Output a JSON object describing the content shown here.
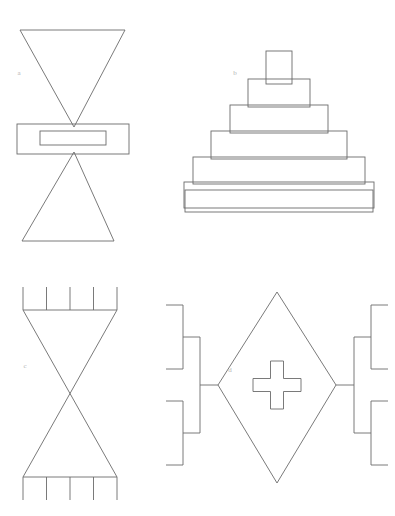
{
  "figure": {
    "background_color": "#ffffff",
    "stroke_color": "#6b6b6b",
    "label_color": "#b4b4b4",
    "canvas": {
      "width": 395,
      "height": 516
    },
    "panels": [
      {
        "id": "a",
        "label": "a",
        "label_x": 19,
        "label_y": 73,
        "description": "Inverted triangle above a horizontal rectangle with an inner rectangle, above an upright triangle",
        "shapes": {
          "top_triangle": "20,30 125,30 74,127",
          "outer_rectangle": {
            "x": 17,
            "y": 124,
            "width": 112,
            "height": 30
          },
          "inner_rectangle": {
            "x": 40,
            "y": 131,
            "width": 66,
            "height": 14
          },
          "bottom_triangle": "74,152 22,241 114,241"
        }
      },
      {
        "id": "b",
        "label": "b",
        "label_x": 235,
        "label_y": 73,
        "description": "Stepped pyramid built from seven overlapping rectangles",
        "step_count": 7,
        "rectangles": [
          {
            "x": 266,
            "y": 51,
            "width": 26,
            "height": 33
          },
          {
            "x": 248,
            "y": 79,
            "width": 62,
            "height": 28
          },
          {
            "x": 230,
            "y": 105,
            "width": 98,
            "height": 28
          },
          {
            "x": 211,
            "y": 131,
            "width": 136,
            "height": 28
          },
          {
            "x": 193,
            "y": 157,
            "width": 172,
            "height": 27
          },
          {
            "x": 184,
            "y": 182,
            "width": 190,
            "height": 26
          },
          {
            "x": 185,
            "y": 190,
            "width": 188,
            "height": 22
          }
        ]
      },
      {
        "id": "c",
        "label": "c",
        "label_x": 25,
        "label_y": 366,
        "description": "Bowtie / hourglass between two comb bars with five teeth each",
        "shapes": {
          "top_bar_y": 310,
          "top_bar_x1": 23,
          "top_bar_x2": 117,
          "top_teeth_y": 287,
          "bottom_bar_y": 477,
          "bottom_bar_x1": 23,
          "bottom_bar_x2": 117,
          "bottom_teeth_y": 500,
          "teeth_count": 5,
          "bowtie": "23,310 117,310 23,477 117,477"
        }
      },
      {
        "id": "d",
        "label": "d",
        "label_x": 230,
        "label_y": 370,
        "description": "Diamond containing a plus/cross, flanked by mirrored tournament brackets",
        "shapes": {
          "diamond": "277,292 336,385 277,483 218,385",
          "cross_center_x": 277,
          "cross_center_y": 385,
          "cross_arm_length": 24,
          "cross_arm_width": 13,
          "left_bracket_stem_x": 218,
          "right_bracket_stem_x": 336,
          "bracket_center_y": 385
        }
      }
    ]
  }
}
